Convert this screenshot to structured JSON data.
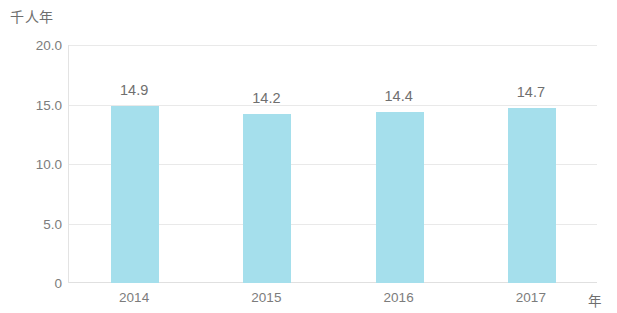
{
  "chart_data": {
    "type": "bar",
    "title": "",
    "subtitle": "",
    "xlabel": "年",
    "ylabel": "千人年",
    "categories": [
      "2014",
      "2015",
      "2016",
      "2017"
    ],
    "values": [
      14.9,
      14.2,
      14.4,
      14.7
    ],
    "value_labels": [
      "14.9",
      "14.2",
      "14.4",
      "14.7"
    ],
    "ylim": [
      0,
      20
    ],
    "y_ticks": [
      0,
      5.0,
      10.0,
      15.0,
      20.0
    ],
    "y_tick_labels": [
      "0",
      "5.0",
      "10.0",
      "15.0",
      "20.0"
    ],
    "grid": true,
    "legend": null,
    "bar_color": "#a5dfec",
    "text_color": "#7c7c7c",
    "grid_color": "#e9e9e9",
    "background_color": "#ffffff"
  }
}
